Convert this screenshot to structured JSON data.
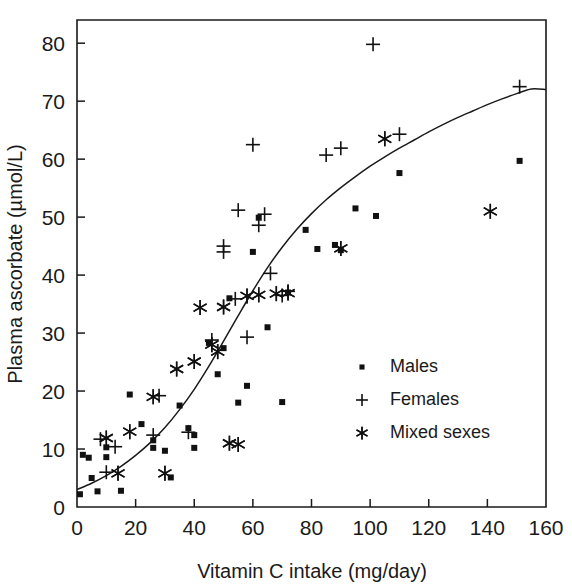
{
  "chart_data": {
    "type": "scatter",
    "title": "",
    "xlabel": "Vitamin C intake (mg/day)",
    "ylabel": "Plasma ascorbate (µmol/L)",
    "xlim": [
      0,
      160
    ],
    "ylim": [
      0,
      84
    ],
    "xticks": [
      0,
      20,
      40,
      60,
      80,
      100,
      120,
      140,
      160
    ],
    "yticks": [
      0,
      10,
      20,
      30,
      40,
      50,
      60,
      70,
      80
    ],
    "xtick_labels": [
      "0",
      "20",
      "40",
      "60",
      "80",
      "100",
      "120",
      "140",
      "160"
    ],
    "ytick_labels": [
      "0",
      "10",
      "20",
      "30",
      "40",
      "50",
      "60",
      "70",
      "80"
    ],
    "grid": false,
    "legend_position": "center-right",
    "marker_color": "#111111",
    "curve_color": "#1a1a1a",
    "series": [
      {
        "name": "Males",
        "marker": "square",
        "points": [
          [
            1,
            2.2
          ],
          [
            2,
            9.0
          ],
          [
            4,
            8.5
          ],
          [
            5,
            5.0
          ],
          [
            7,
            2.7
          ],
          [
            10,
            10.3
          ],
          [
            10,
            8.6
          ],
          [
            15,
            2.8
          ],
          [
            18,
            19.4
          ],
          [
            22,
            14.3
          ],
          [
            26,
            10.2
          ],
          [
            26,
            11.5
          ],
          [
            30,
            9.7
          ],
          [
            32,
            5.1
          ],
          [
            35,
            17.5
          ],
          [
            38,
            13.6
          ],
          [
            40,
            10.2
          ],
          [
            40,
            12.4
          ],
          [
            45,
            28.3
          ],
          [
            48,
            22.9
          ],
          [
            50,
            27.4
          ],
          [
            52,
            36.0
          ],
          [
            55,
            18.0
          ],
          [
            58,
            20.9
          ],
          [
            60,
            44.0
          ],
          [
            62,
            49.9
          ],
          [
            65,
            31.0
          ],
          [
            70,
            18.1
          ],
          [
            72,
            37.0
          ],
          [
            78,
            47.8
          ],
          [
            82,
            44.5
          ],
          [
            88,
            45.2
          ],
          [
            90,
            44.3
          ],
          [
            95,
            51.5
          ],
          [
            102,
            50.2
          ],
          [
            110,
            57.6
          ],
          [
            151,
            59.7
          ]
        ]
      },
      {
        "name": "Females",
        "marker": "plus",
        "points": [
          [
            8,
            11.7
          ],
          [
            10,
            6.0
          ],
          [
            13,
            10.4
          ],
          [
            26,
            12.4
          ],
          [
            28,
            19.2
          ],
          [
            38,
            12.9
          ],
          [
            46,
            28.8
          ],
          [
            50,
            45.0
          ],
          [
            50,
            44.0
          ],
          [
            54,
            35.9
          ],
          [
            55,
            51.2
          ],
          [
            58,
            29.3
          ],
          [
            60,
            62.5
          ],
          [
            62,
            48.6
          ],
          [
            64,
            50.5
          ],
          [
            66,
            40.3
          ],
          [
            70,
            36.5
          ],
          [
            72,
            37.2
          ],
          [
            85,
            60.7
          ],
          [
            90,
            61.9
          ],
          [
            101,
            79.8
          ],
          [
            110,
            64.3
          ],
          [
            151,
            72.5
          ]
        ]
      },
      {
        "name": "Mixed sexes",
        "marker": "asterisk",
        "points": [
          [
            10,
            11.9
          ],
          [
            14,
            5.8
          ],
          [
            18,
            13.0
          ],
          [
            26,
            19.0
          ],
          [
            30,
            5.8
          ],
          [
            34,
            23.8
          ],
          [
            40,
            25.1
          ],
          [
            42,
            34.4
          ],
          [
            46,
            28.0
          ],
          [
            48,
            26.8
          ],
          [
            50,
            34.5
          ],
          [
            52,
            11.0
          ],
          [
            55,
            10.8
          ],
          [
            58,
            36.4
          ],
          [
            62,
            36.6
          ],
          [
            68,
            36.8
          ],
          [
            72,
            36.9
          ],
          [
            90,
            44.6
          ],
          [
            105,
            63.5
          ],
          [
            141,
            51.0
          ]
        ]
      }
    ],
    "fit_curve": {
      "name": "sigmoid-fit",
      "points": [
        [
          0,
          3.0
        ],
        [
          5,
          4.1
        ],
        [
          10,
          5.4
        ],
        [
          15,
          7.0
        ],
        [
          20,
          8.9
        ],
        [
          25,
          11.1
        ],
        [
          30,
          13.7
        ],
        [
          35,
          16.8
        ],
        [
          40,
          20.3
        ],
        [
          45,
          24.3
        ],
        [
          50,
          28.6
        ],
        [
          55,
          33.0
        ],
        [
          60,
          37.3
        ],
        [
          65,
          41.3
        ],
        [
          70,
          44.8
        ],
        [
          75,
          47.9
        ],
        [
          80,
          50.6
        ],
        [
          85,
          53.0
        ],
        [
          90,
          55.1
        ],
        [
          95,
          57.0
        ],
        [
          100,
          58.8
        ],
        [
          105,
          60.4
        ],
        [
          110,
          61.9
        ],
        [
          115,
          63.3
        ],
        [
          120,
          64.7
        ],
        [
          125,
          66.0
        ],
        [
          130,
          67.2
        ],
        [
          135,
          68.3
        ],
        [
          140,
          69.4
        ],
        [
          145,
          70.4
        ],
        [
          150,
          71.3
        ],
        [
          155,
          72.1
        ],
        [
          160,
          72.0
        ]
      ]
    }
  },
  "legend": {
    "entries": [
      {
        "label": "Males",
        "marker": "square"
      },
      {
        "label": "Females",
        "marker": "plus"
      },
      {
        "label": "Mixed sexes",
        "marker": "asterisk"
      }
    ]
  },
  "axes": {
    "x_title": "Vitamin C intake (mg/day)",
    "y_title": "Plasma ascorbate (µmol/L)"
  }
}
